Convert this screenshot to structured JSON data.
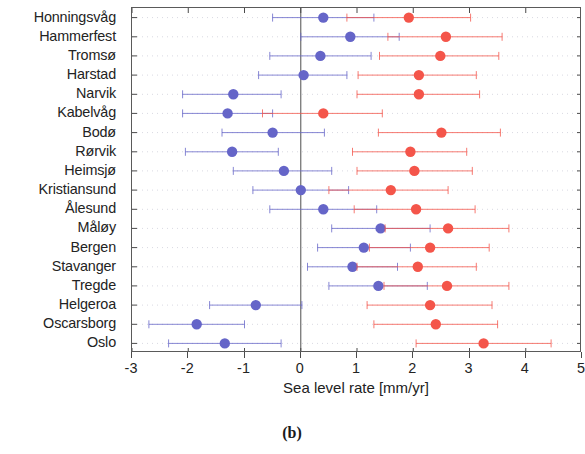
{
  "caption": "(b)",
  "chart_data": {
    "type": "scatter",
    "orientation": "horizontal",
    "title": "",
    "xlabel": "Sea level rate [mm/yr]",
    "ylabel": "",
    "xlim": [
      -3,
      5
    ],
    "ylim": [
      0,
      18
    ],
    "xticks": [
      -3,
      -2,
      -1,
      0,
      1,
      2,
      3,
      4,
      5
    ],
    "xticklabels": [
      "-3",
      "-2",
      "-1",
      "0",
      "1",
      "2",
      "3",
      "4",
      "5"
    ],
    "grid": "dotted-faint",
    "legend": "none",
    "reference_line_x": 0,
    "categories": [
      "Honningsvåg",
      "Hammerfest",
      "Tromsø",
      "Harstad",
      "Narvik",
      "Kabelvåg",
      "Bodø",
      "Rørvik",
      "Heimsjø",
      "Kristiansund",
      "Ålesund",
      "Måløy",
      "Bergen",
      "Stavanger",
      "Tregde",
      "Helgeroa",
      "Oscarsborg",
      "Oslo"
    ],
    "series": [
      {
        "name": "blue",
        "color": "#6565c8",
        "marker": "circle",
        "values": [
          0.4,
          0.88,
          0.35,
          0.05,
          -1.2,
          -1.3,
          -0.5,
          -1.22,
          -0.3,
          0.0,
          0.4,
          1.42,
          1.12,
          0.92,
          1.38,
          -0.8,
          -1.85,
          -1.35
        ],
        "err_low": [
          -0.5,
          0.0,
          -0.55,
          -0.75,
          -2.1,
          -2.1,
          -1.4,
          -2.05,
          -1.2,
          -0.85,
          -0.55,
          0.55,
          0.3,
          0.12,
          0.5,
          -1.62,
          -2.7,
          -2.35
        ],
        "err_high": [
          1.3,
          1.75,
          1.25,
          0.82,
          -0.35,
          -0.5,
          0.42,
          -0.4,
          0.55,
          0.85,
          1.35,
          2.3,
          1.95,
          1.72,
          2.25,
          0.02,
          -1.0,
          -0.35
        ]
      },
      {
        "name": "red",
        "color": "#f4554a",
        "marker": "circle",
        "values": [
          1.92,
          2.58,
          2.48,
          2.1,
          2.1,
          0.4,
          2.5,
          1.95,
          2.02,
          1.6,
          2.05,
          2.62,
          2.3,
          2.08,
          2.6,
          2.3,
          2.4,
          3.25
        ],
        "err_low": [
          0.82,
          1.55,
          1.4,
          1.02,
          1.0,
          -0.68,
          1.38,
          0.92,
          1.0,
          0.5,
          0.95,
          1.5,
          1.22,
          1.0,
          1.48,
          1.18,
          1.3,
          2.05
        ],
        "err_high": [
          3.02,
          3.58,
          3.52,
          3.12,
          3.18,
          1.45,
          3.55,
          2.95,
          3.05,
          2.62,
          3.1,
          3.7,
          3.35,
          3.12,
          3.7,
          3.4,
          3.5,
          4.45
        ]
      }
    ]
  }
}
